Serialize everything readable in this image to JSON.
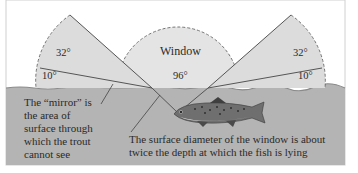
{
  "diagram": {
    "colors": {
      "background": "#ffffff",
      "water": "#b4b4b4",
      "wedge_fill": "#dcdcdc",
      "window_fill": "#e4e4e4",
      "line": "#555555",
      "text": "#2a2a2a"
    },
    "labels": {
      "window": "Window",
      "window_angle": "96°",
      "left_upper_angle": "32°",
      "left_lower_angle": "10°",
      "right_upper_angle": "32°",
      "right_lower_angle": "10°"
    },
    "mirror_caption": {
      "lines": [
        "The “mirror” is",
        "the area of",
        "surface through",
        "which the trout",
        "cannot see"
      ]
    },
    "window_caption": {
      "lines": [
        "The surface diameter of the window is about",
        "twice the depth at which the fish is lying"
      ]
    },
    "subject": "trout"
  }
}
